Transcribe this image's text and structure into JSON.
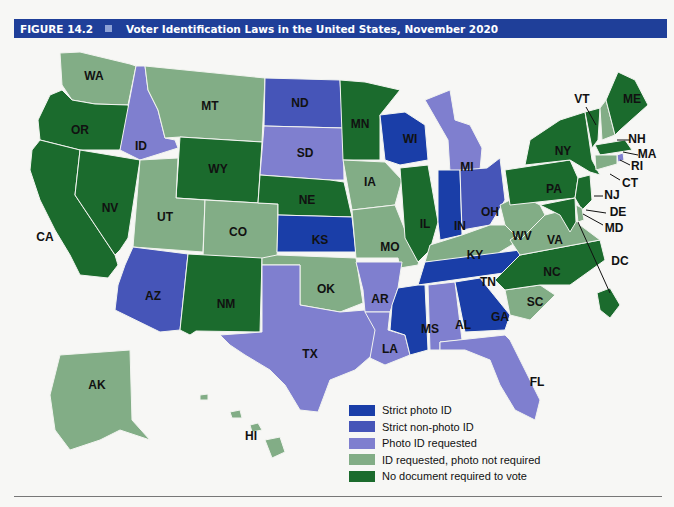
{
  "header": {
    "figure_label": "FIGURE 14.2",
    "title": "Voter Identification Laws in the United States, November 2020",
    "background": "#1f3f99"
  },
  "categories": {
    "strict_photo": {
      "label": "Strict photo ID",
      "color": "#1a3ea8"
    },
    "strict_nonphoto": {
      "label": "Strict non-photo ID",
      "color": "#4655b8"
    },
    "photo_requested": {
      "label": "Photo ID requested",
      "color": "#7f7fcf"
    },
    "id_requested": {
      "label": "ID requested, photo not required",
      "color": "#82ad86"
    },
    "no_document": {
      "label": "No document required to vote",
      "color": "#1b6b2d"
    }
  },
  "legend": [
    {
      "key": "strict_photo",
      "label": "Strict photo ID"
    },
    {
      "key": "strict_nonphoto",
      "label": "Strict non-photo ID"
    },
    {
      "key": "photo_requested",
      "label": "Photo ID requested"
    },
    {
      "key": "id_requested",
      "label": "ID requested, photo not required"
    },
    {
      "key": "no_document",
      "label": "No document required to vote"
    }
  ],
  "states": {
    "WA": "id_requested",
    "OR": "no_document",
    "CA": "no_document",
    "NV": "no_document",
    "ID": "photo_requested",
    "MT": "id_requested",
    "WY": "no_document",
    "UT": "id_requested",
    "CO": "id_requested",
    "AZ": "strict_nonphoto",
    "NM": "no_document",
    "ND": "strict_nonphoto",
    "SD": "photo_requested",
    "NE": "no_document",
    "KS": "strict_photo",
    "OK": "id_requested",
    "TX": "photo_requested",
    "MN": "no_document",
    "IA": "id_requested",
    "MO": "id_requested",
    "AR": "photo_requested",
    "LA": "photo_requested",
    "WI": "strict_photo",
    "IL": "no_document",
    "MI": "photo_requested",
    "IN": "strict_photo",
    "OH": "strict_nonphoto",
    "KY": "id_requested",
    "TN": "strict_photo",
    "MS": "strict_photo",
    "AL": "photo_requested",
    "GA": "strict_photo",
    "FL": "photo_requested",
    "SC": "id_requested",
    "NC": "no_document",
    "VA": "id_requested",
    "WV": "id_requested",
    "PA": "no_document",
    "NY": "no_document",
    "VT": "no_document",
    "NH": "id_requested",
    "ME": "no_document",
    "MA": "no_document",
    "RI": "photo_requested",
    "CT": "id_requested",
    "NJ": "no_document",
    "DE": "id_requested",
    "MD": "no_document",
    "DC": "no_document",
    "AK": "id_requested",
    "HI": "id_requested"
  },
  "labels": {
    "WA": "WA",
    "OR": "OR",
    "CA": "CA",
    "NV": "NV",
    "ID": "ID",
    "MT": "MT",
    "WY": "WY",
    "UT": "UT",
    "CO": "CO",
    "AZ": "AZ",
    "NM": "NM",
    "ND": "ND",
    "SD": "SD",
    "NE": "NE",
    "KS": "KS",
    "OK": "OK",
    "TX": "TX",
    "MN": "MN",
    "IA": "IA",
    "MO": "MO",
    "AR": "AR",
    "LA": "LA",
    "WI": "WI",
    "IL": "IL",
    "MI": "MI",
    "IN": "IN",
    "OH": "OH",
    "KY": "KY",
    "TN": "TN",
    "MS": "MS",
    "AL": "AL",
    "GA": "GA",
    "FL": "FL",
    "SC": "SC",
    "NC": "NC",
    "VA": "VA",
    "WV": "WV",
    "PA": "PA",
    "NY": "NY",
    "VT": "VT",
    "NH": "NH",
    "ME": "ME",
    "MA": "MA",
    "RI": "RI",
    "CT": "CT",
    "NJ": "NJ",
    "DE": "DE",
    "MD": "MD",
    "DC": "DC",
    "AK": "AK",
    "HI": "HI"
  }
}
